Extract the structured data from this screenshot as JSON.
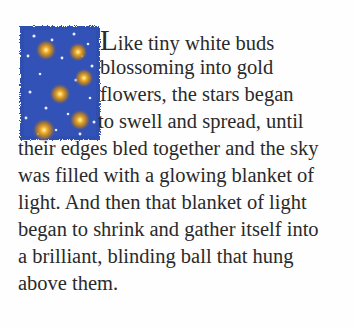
{
  "illustration": {
    "subject": "night sky with glowing gold stars and white dots",
    "background_color": "#2f4fb0",
    "star_color": "#e0a020",
    "dot_color": "#e8eefc"
  },
  "passage": {
    "drop_cap": "L",
    "lines": [
      "ike tiny white buds",
      "blossoming into gold",
      "flowers, the stars began",
      "to swell and spread, until",
      "their edges bled together and the sky",
      "was filled with a glowing blanket of",
      "light. And then that blanket of light",
      "began to shrink and gather itself into",
      "a brilliant, blinding ball that hung",
      "above them."
    ]
  }
}
